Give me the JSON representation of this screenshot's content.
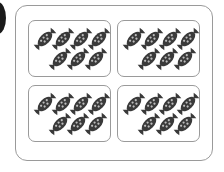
{
  "figure": {
    "groups": [
      {
        "position": "top-left",
        "count": 7,
        "rows": [
          4,
          3
        ]
      },
      {
        "position": "top-right",
        "count": 7,
        "rows": [
          4,
          3
        ]
      },
      {
        "position": "bottom-left",
        "count": 7,
        "rows": [
          4,
          3
        ]
      },
      {
        "position": "bottom-right",
        "count": 7,
        "rows": [
          4,
          3
        ]
      }
    ],
    "item_icon": "wrapped-candy-icon",
    "colors": {
      "candy": "#3a3a3a",
      "candy_dots": "#bdbdbd",
      "border": "#9a9a9a",
      "background": "#ffffff"
    }
  }
}
